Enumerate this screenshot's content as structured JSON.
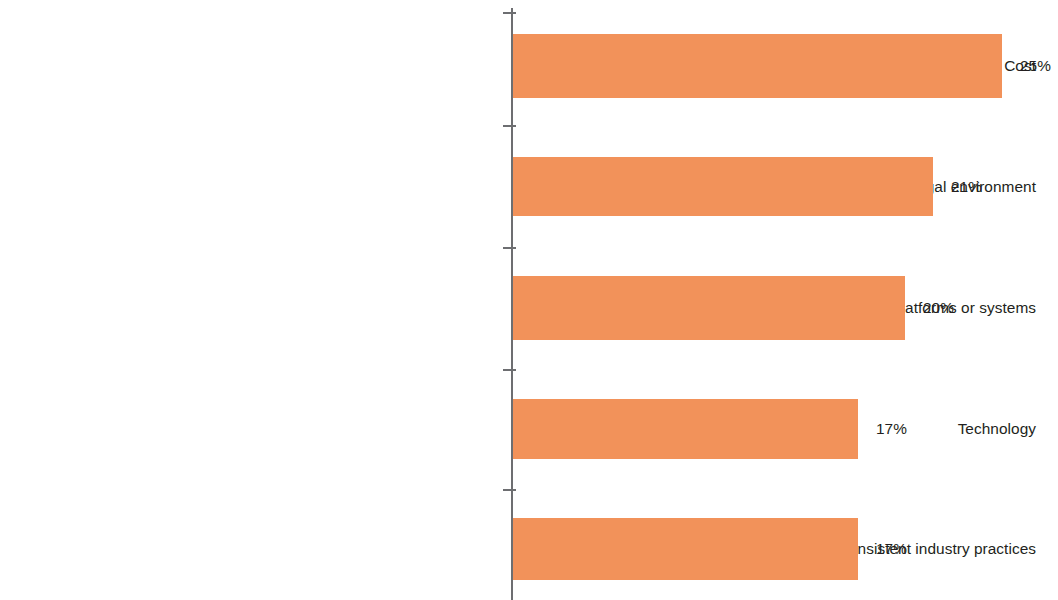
{
  "chart_data": {
    "type": "bar",
    "orientation": "horizontal",
    "title": "",
    "subtitle": "",
    "xlabel": "",
    "ylabel": "",
    "grid": false,
    "legend": false,
    "legend_position": "none",
    "xlim": [
      0,
      26
    ],
    "value_suffix": "%",
    "bar_color": "#f2925a",
    "text_color": "#231f20",
    "axis_color": "#6d6e71",
    "categories": [
      "Cost",
      "Legal environment",
      "Lack of interoperability of existing platforms or systems",
      "Technology",
      "Inconsistent industry practices"
    ],
    "values": [
      25,
      21,
      20,
      17,
      17
    ],
    "value_labels": [
      "25%",
      "21%",
      "20%",
      "17%",
      "17%"
    ],
    "series": [
      {
        "name": "Share of respondents",
        "values": [
          25,
          21,
          20,
          17,
          17
        ]
      }
    ],
    "bars": [
      {
        "category": "Cost",
        "value": 25,
        "value_label": "25%",
        "top": 34,
        "height": 64,
        "width": 489
      },
      {
        "category": "Legal environment",
        "value": 21,
        "value_label": "21%",
        "top": 157,
        "height": 59,
        "width": 420
      },
      {
        "category": "Lack of interoperability of existing platforms or systems",
        "value": 20,
        "value_label": "20%",
        "top": 276,
        "height": 64,
        "width": 392
      },
      {
        "category": "Technology",
        "value": 17,
        "value_label": "17%",
        "top": 399,
        "height": 60,
        "width": 345
      },
      {
        "category": "Inconsistent industry practices",
        "value": 17,
        "value_label": "17%",
        "top": 518,
        "height": 62,
        "width": 345
      }
    ],
    "ticks": [
      12,
      125,
      247,
      369,
      489
    ]
  }
}
